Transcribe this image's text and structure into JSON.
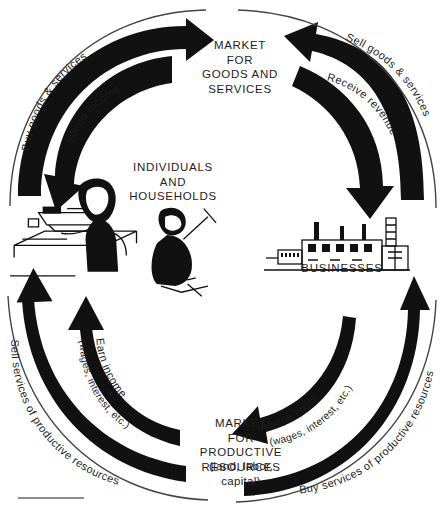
{
  "diagram": {
    "type": "circular-flow",
    "nodes": {
      "market_goods": {
        "label": "MARKET\nFOR\nGOODS AND\nSERVICES",
        "name": "market-for-goods-and-services"
      },
      "households": {
        "label": "INDIVIDUALS\nAND\nHOUSEHOLDS",
        "name": "individuals-and-households"
      },
      "businesses": {
        "label": "BUSINESSES",
        "name": "businesses"
      },
      "market_resources": {
        "label": "MARKET\nFOR\nPRODUCTIVE\nRESOURCES",
        "sublabel": "(land, labor,\ncapital)",
        "name": "market-for-productive-resources"
      }
    },
    "flows": {
      "buy_goods": "Buy goods & services",
      "spend_income": "Spend income",
      "sell_goods": "Sell goods & services",
      "receive_revenue": "Receive revenue",
      "sell_services": "Sell services of productive resources",
      "earn_income": "Earn  income",
      "earn_income_sub": "(wages,  interest,  etc.)",
      "income_costs": "Income  costs",
      "income_costs_sub": "(wages,  interest,  etc.)",
      "buy_services": "Buy services of productive resources"
    },
    "colors": {
      "ink": "#111111",
      "text": "#1d1d1d",
      "background": "#ffffff",
      "rule": "#8a8a8a"
    }
  }
}
